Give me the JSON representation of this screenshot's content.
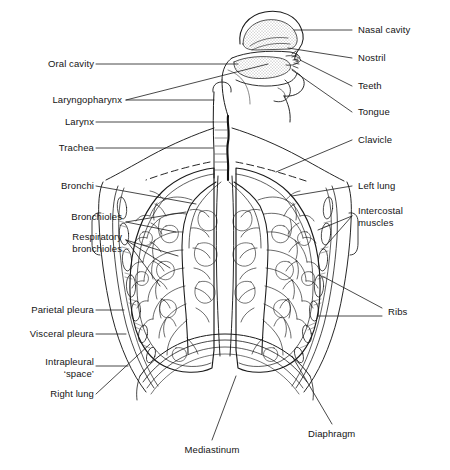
{
  "figure": {
    "style": "black line drawing on white",
    "colors": {
      "ink": "#141414",
      "background": "#ffffff",
      "stipple": "#4a4a4a"
    }
  },
  "labels_left": [
    {
      "id": "oral-cavity",
      "text": "Oral cavity"
    },
    {
      "id": "laryngopharynx",
      "text": "Laryngopharynx"
    },
    {
      "id": "larynx",
      "text": "Larynx"
    },
    {
      "id": "trachea",
      "text": "Trachea"
    },
    {
      "id": "bronchi",
      "text": "Bronchi"
    },
    {
      "id": "bronchioles",
      "text": "Bronchioles"
    },
    {
      "id": "respiratory-bronchioles",
      "text": "Respiratory\nbronchioles"
    },
    {
      "id": "parietal-pleura",
      "text": "Parietal pleura"
    },
    {
      "id": "visceral-pleura",
      "text": "Visceral pleura"
    },
    {
      "id": "intrapleural-space",
      "text": "Intrapleural\n‘space’"
    },
    {
      "id": "right-lung",
      "text": "Right lung"
    }
  ],
  "labels_right": [
    {
      "id": "nasal-cavity",
      "text": "Nasal cavity"
    },
    {
      "id": "nostril",
      "text": "Nostril"
    },
    {
      "id": "teeth",
      "text": "Teeth"
    },
    {
      "id": "tongue",
      "text": "Tongue"
    },
    {
      "id": "clavicle",
      "text": "Clavicle"
    },
    {
      "id": "left-lung",
      "text": "Left lung"
    },
    {
      "id": "intercostal-muscles",
      "text": "Intercostal\nmuscles"
    },
    {
      "id": "ribs",
      "text": "Ribs"
    },
    {
      "id": "diaphragm",
      "text": "Diaphragm"
    }
  ],
  "labels_bottom": [
    {
      "id": "mediastinum",
      "text": "Mediastinum"
    }
  ]
}
